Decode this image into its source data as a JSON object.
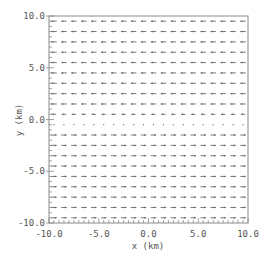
{
  "chart_data": {
    "type": "quiver",
    "title": "",
    "xlabel": "x (km)",
    "ylabel": "y (km)",
    "xlim": [
      -10,
      10
    ],
    "ylim": [
      -10,
      10
    ],
    "xticks": [
      "-10.0",
      "-5.0",
      "0.0",
      "5.0",
      "10.0"
    ],
    "yticks": [
      "10.0",
      "5.0",
      "0.0",
      "-5.0",
      "-10.0"
    ],
    "xtick_values": [
      -10,
      -5,
      0,
      5,
      10
    ],
    "ytick_values": [
      10,
      5,
      0,
      -5,
      -10
    ],
    "minor_tick_step": 0.5,
    "grid": false,
    "legend": null,
    "x": [
      -9.5,
      -8.5,
      -7.5,
      -6.5,
      -5.5,
      -4.5,
      -3.5,
      -2.5,
      -1.5,
      -0.5,
      0.5,
      1.5,
      2.5,
      3.5,
      4.5,
      5.5,
      6.5,
      7.5,
      8.5,
      9.5
    ],
    "y": [
      9.5,
      8.5,
      7.5,
      6.5,
      5.5,
      4.5,
      3.5,
      2.5,
      1.5,
      0.5,
      -0.5,
      -1.5,
      -2.5,
      -3.5,
      -4.5,
      -5.5,
      -6.5,
      -7.5,
      -8.5,
      -9.5
    ],
    "field": {
      "description": "Horizontal shear flow: vectors point left (u<0) for y>0, near zero at the row just below y=0, and point right (u>0) for y<0; v = 0 everywhere",
      "u_by_row": [
        -1,
        -1,
        -1,
        -1,
        -1,
        -1,
        -1,
        -1,
        -1,
        -0.8,
        0,
        1,
        1,
        1,
        1,
        1,
        1,
        1,
        1,
        1
      ],
      "v": 0
    },
    "colors": {
      "axis": "#8a8a8a",
      "arrow": "#6a6a6a",
      "text": "#555555"
    }
  }
}
